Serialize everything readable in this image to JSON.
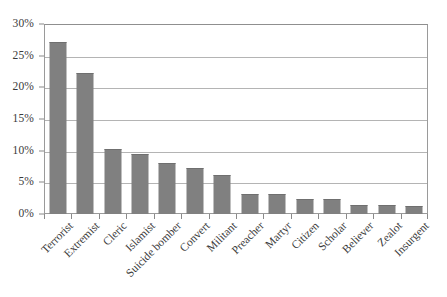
{
  "chart_data": {
    "type": "bar",
    "title": "",
    "subtitle": "",
    "xlabel": "",
    "ylabel": "",
    "categories": [
      "Terrorist",
      "Extremist",
      "Cleric",
      "Islamist",
      "Suicide bomber",
      "Convert",
      "Militant",
      "Preacher",
      "Martyr",
      "Citizen",
      "Scholar",
      "Believer",
      "Zealot",
      "Insurgent"
    ],
    "values": [
      27.2,
      22.3,
      10.2,
      9.4,
      8.1,
      7.2,
      6.1,
      3.2,
      3.2,
      2.4,
      2.3,
      1.4,
      1.4,
      1.2
    ],
    "value_labels": [
      "27.2%",
      "22.3%",
      "10.2%",
      "9.4%",
      "8.1%",
      "7.2%",
      "6.1%",
      "3.2%",
      "3.2%",
      "2.4%",
      "2.3%",
      "1.4%",
      "1.4%",
      "1.2%"
    ],
    "ylim": [
      0,
      30
    ],
    "ytick_values": [
      0,
      5,
      10,
      15,
      20,
      25,
      30
    ],
    "ytick_labels": [
      "0%",
      "5%",
      "10%",
      "15%",
      "20%",
      "25%",
      "30%"
    ],
    "grid": true,
    "grid_axis": "y",
    "legend": false,
    "legend_position": "none",
    "series": [
      {
        "name": "",
        "values": [
          27.2,
          22.3,
          10.2,
          9.4,
          8.1,
          7.2,
          6.1,
          3.2,
          3.2,
          2.4,
          2.3,
          1.4,
          1.4,
          1.2
        ]
      }
    ]
  },
  "style": {
    "bar_color": "#808080",
    "bar_edge_color": "#6f6f6f",
    "grid_color": "#b4b4b4",
    "axis_color": "#8a8a8a",
    "plot_border_color": "#9a9a9a",
    "background": "#ffffff",
    "text_color": "#3a3a3a",
    "xlabel_rotation_deg": -45
  }
}
